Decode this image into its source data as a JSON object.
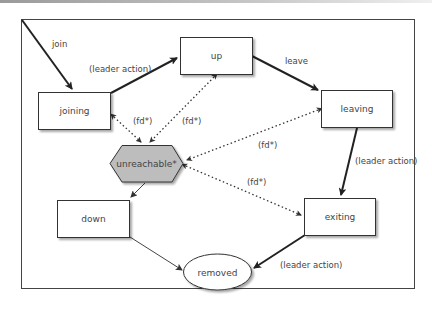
{
  "diagram": {
    "type": "state-machine",
    "nodes": [
      {
        "id": "joining",
        "label": "joining",
        "shape": "rect"
      },
      {
        "id": "up",
        "label": "up",
        "shape": "rect"
      },
      {
        "id": "leaving",
        "label": "leaving",
        "shape": "rect"
      },
      {
        "id": "unreachable",
        "label": "unreachable*",
        "shape": "hexagon",
        "fill": "#bdbdbd"
      },
      {
        "id": "down",
        "label": "down",
        "shape": "rect"
      },
      {
        "id": "exiting",
        "label": "exiting",
        "shape": "rect"
      },
      {
        "id": "removed",
        "label": "removed",
        "shape": "ellipse"
      }
    ],
    "edges": [
      {
        "from": "start",
        "to": "joining",
        "label": "join",
        "style": "solid-bold"
      },
      {
        "from": "joining",
        "to": "up",
        "label": "(leader action)",
        "style": "solid-bold"
      },
      {
        "from": "up",
        "to": "leaving",
        "label": "leave",
        "style": "solid-bold"
      },
      {
        "from": "leaving",
        "to": "exiting",
        "label": "(leader action)",
        "style": "solid-bold"
      },
      {
        "from": "exiting",
        "to": "removed",
        "label": "(leader action)",
        "style": "solid-bold"
      },
      {
        "from": "unreachable",
        "to": "down",
        "label": "",
        "style": "solid-thin"
      },
      {
        "from": "down",
        "to": "removed",
        "label": "",
        "style": "solid-thin"
      },
      {
        "from": "joining",
        "to": "unreachable",
        "label": "(fd*)",
        "style": "dotted-bidirectional"
      },
      {
        "from": "up",
        "to": "unreachable",
        "label": "(fd*)",
        "style": "dotted-bidirectional"
      },
      {
        "from": "leaving",
        "to": "unreachable",
        "label": "(fd*)",
        "style": "dotted-bidirectional"
      },
      {
        "from": "exiting",
        "to": "unreachable",
        "label": "(fd*)",
        "style": "dotted-bidirectional"
      }
    ]
  },
  "labels": {
    "join": "join",
    "leader_action_1": "(leader action)",
    "leave": "leave",
    "fd_joining": "(fd*)",
    "fd_up": "(fd*)",
    "fd_leaving": "(fd*)",
    "fd_exiting": "(fd*)",
    "leader_action_2": "(leader action)",
    "leader_action_3": "(leader action)"
  },
  "nodes": {
    "joining": "joining",
    "up": "up",
    "leaving": "leaving",
    "unreachable": "unreachable*",
    "down": "down",
    "exiting": "exiting",
    "removed": "removed"
  },
  "colors": {
    "stroke": "#333333",
    "hexagon_fill": "#bdbdbd",
    "node_fill": "#ffffff",
    "text": "#444444"
  }
}
